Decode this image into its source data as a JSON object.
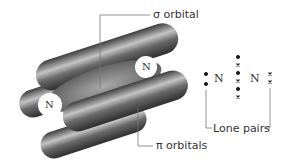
{
  "labels": {
    "sigma": "σ orbital",
    "pi": "π orbitals",
    "lone_pairs": "Lone pairs",
    "atom_left": "N",
    "atom_right": "N",
    "lewis_n1": "N",
    "lewis_n2": "N"
  },
  "colors": {
    "lobe": "#5a5a5a",
    "lobe_highlight": "#b8b8b8",
    "line": "#777777"
  }
}
